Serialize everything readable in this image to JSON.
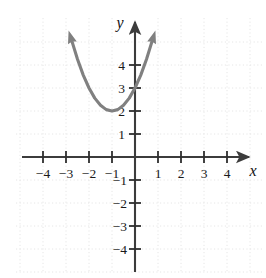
{
  "chart_data": {
    "type": "line",
    "title": "",
    "subtitle": "",
    "xlabel": "x",
    "ylabel": "y",
    "xlim": [
      -5.0,
      5.2
    ],
    "ylim": [
      -5.0,
      5.2
    ],
    "grid": true,
    "grid_style": "dotted",
    "legend": "none",
    "x_ticks": [
      -4,
      -3,
      -2,
      -1,
      1,
      2,
      3,
      4
    ],
    "y_ticks": [
      4,
      3,
      2,
      1,
      -1,
      -2,
      -3,
      -4
    ],
    "x_tick_labels": [
      "−4",
      "−3",
      "−2",
      "−1",
      "1",
      "2",
      "3",
      "4"
    ],
    "y_tick_labels": [
      "4",
      "3",
      "2",
      "1",
      "−1",
      "−2",
      "−3",
      "−4"
    ],
    "series": [
      {
        "name": "parabola",
        "equation": "y = (x + 1)^2 + 2",
        "color": "#808080",
        "vertex": [
          -1,
          2
        ],
        "arrow_start": true,
        "arrow_end": true,
        "x": [
          -2.75,
          -2.5,
          -2.25,
          -2.0,
          -1.75,
          -1.5,
          -1.25,
          -1.0,
          -0.75,
          -0.5,
          -0.25,
          0.0,
          0.25,
          0.5,
          0.75
        ],
        "y": [
          5.06,
          4.25,
          3.56,
          3.0,
          2.56,
          2.25,
          2.06,
          2.0,
          2.06,
          2.25,
          2.56,
          3.0,
          3.56,
          4.25,
          5.06
        ]
      }
    ],
    "annotations": []
  },
  "colors": {
    "curve": "#808080",
    "axis": "#3c3c3c",
    "grid": "#e4e4e4",
    "text": "#1a1a1a",
    "background": "#ffffff"
  },
  "axes": {
    "x_axis_name": "x",
    "y_axis_name": "y",
    "origin_label": ""
  }
}
